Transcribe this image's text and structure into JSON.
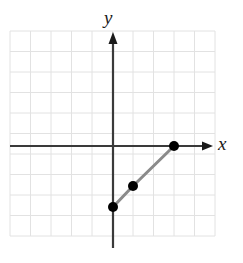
{
  "figure": {
    "kind": "coordinate-plane-graph",
    "width": 243,
    "height": 263,
    "background_color": "#ffffff"
  },
  "axes": {
    "x_label": "x",
    "y_label": "y",
    "axis_color": "#3a3a3a",
    "arrow_color": "#1a1a1a",
    "x_axis_has_arrow": true,
    "y_axis_has_arrow": true,
    "origin_px": {
      "x": 113,
      "y": 146
    }
  },
  "grid": {
    "show": true,
    "color": "#e2e2e2",
    "cell_size_px": 20.5,
    "columns": 10,
    "rows": 10,
    "left_px": 10,
    "top_px": 31,
    "right_px": 215,
    "bottom_px": 236,
    "x_range": [
      -5,
      5
    ],
    "y_range": [
      -5,
      5
    ]
  },
  "chart_data": {
    "type": "scatter",
    "title": "",
    "xlabel": "x",
    "ylabel": "y",
    "xlim": [
      -5,
      5
    ],
    "ylim": [
      -5,
      5
    ],
    "grid": true,
    "legend": false,
    "series": [
      {
        "name": "segment",
        "marker": "filled-circle",
        "marker_color": "#000000",
        "marker_radius_px": 5,
        "line_color": "#8a8a8a",
        "line_width_px": 3,
        "connected": true,
        "points": [
          {
            "x": 0,
            "y": -3,
            "px": 113,
            "py": 207
          },
          {
            "x": 1,
            "y": -2,
            "px": 133,
            "py": 186
          },
          {
            "x": 3,
            "y": 0,
            "px": 174,
            "py": 146
          }
        ]
      }
    ]
  }
}
